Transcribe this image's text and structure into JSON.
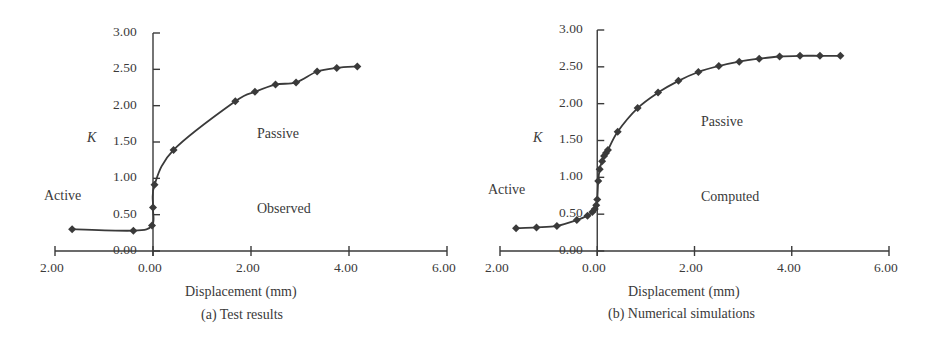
{
  "chart_data": [
    {
      "type": "line",
      "title": "(a) Test results",
      "xlabel": "Displacement (mm)",
      "ylabel": "K",
      "x_tick_labels": [
        "2.00",
        "0.00",
        "2.00",
        "4.00",
        "6.00"
      ],
      "x_ticks": [
        -2,
        0,
        2,
        4,
        6
      ],
      "y_tick_labels": [
        "0.00",
        "0.50",
        "1.00",
        "1.50",
        "2.00",
        "2.50",
        "3.00"
      ],
      "y_ticks": [
        0,
        0.5,
        1.0,
        1.5,
        2.0,
        2.5,
        3.0
      ],
      "xlim": [
        -2,
        6
      ],
      "ylim": [
        0,
        3
      ],
      "grid": false,
      "annotations": [
        "Active",
        "Passive",
        "Observed"
      ],
      "marker": "diamond",
      "series": [
        {
          "name": "Observed",
          "x": [
            -1.65,
            -0.4,
            -0.02,
            0.0,
            0.03,
            0.42,
            1.68,
            2.08,
            2.5,
            2.92,
            3.35,
            3.75,
            4.17
          ],
          "y": [
            0.3,
            0.28,
            0.35,
            0.6,
            0.91,
            1.39,
            2.06,
            2.19,
            2.29,
            2.32,
            2.47,
            2.52,
            2.54
          ]
        }
      ]
    },
    {
      "type": "line",
      "title": "(b) Numerical simulations",
      "xlabel": "Displacement (mm)",
      "ylabel": "K",
      "x_tick_labels": [
        "2.00",
        "0.00",
        "2.00",
        "4.00",
        "6.00"
      ],
      "x_ticks": [
        -2,
        0,
        2,
        4,
        6
      ],
      "y_tick_labels": [
        "0.00",
        "0.50",
        "1.00",
        "1.50",
        "2.00",
        "2.50",
        "3.00"
      ],
      "y_ticks": [
        0,
        0.5,
        1.0,
        1.5,
        2.0,
        2.5,
        3.0
      ],
      "xlim": [
        -2,
        6
      ],
      "ylim": [
        0,
        3
      ],
      "grid": false,
      "annotations": [
        "Active",
        "Passive",
        "Computed"
      ],
      "marker": "diamond",
      "series": [
        {
          "name": "Computed",
          "x": [
            -1.67,
            -1.25,
            -0.83,
            -0.42,
            -0.2,
            -0.1,
            -0.05,
            -0.02,
            0.0,
            0.02,
            0.05,
            0.1,
            0.14,
            0.18,
            0.22,
            0.42,
            0.83,
            1.25,
            1.67,
            2.08,
            2.5,
            2.92,
            3.33,
            3.75,
            4.17,
            4.58,
            5.0
          ],
          "y": [
            0.31,
            0.32,
            0.34,
            0.42,
            0.48,
            0.53,
            0.57,
            0.62,
            0.7,
            0.95,
            1.11,
            1.22,
            1.29,
            1.33,
            1.37,
            1.62,
            1.94,
            2.15,
            2.31,
            2.43,
            2.51,
            2.57,
            2.61,
            2.64,
            2.65,
            2.65,
            2.65
          ]
        }
      ]
    }
  ],
  "panels": [
    {
      "ylabel": "K",
      "xlabel": "Displacement (mm)",
      "caption": "(a) Test results",
      "region_active": "Active",
      "region_passive": "Passive",
      "curve_label": "Observed",
      "y_ticks": [
        "3.00",
        "2.50",
        "2.00",
        "1.50",
        "1.00",
        "0.50",
        "0.00"
      ],
      "x_ticks": [
        "2.00",
        "0.00",
        "2.00",
        "4.00",
        "6.00"
      ]
    },
    {
      "ylabel": "K",
      "xlabel": "Displacement (mm)",
      "caption": "(b) Numerical simulations",
      "region_active": "Active",
      "region_passive": "Passive",
      "curve_label": "Computed",
      "y_ticks": [
        "3.00",
        "2.50",
        "2.00",
        "1.50",
        "1.00",
        "0.50",
        "0.00"
      ],
      "x_ticks": [
        "2.00",
        "0.00",
        "2.00",
        "4.00",
        "6.00"
      ]
    }
  ],
  "colors": {
    "ink": "#3a3a3a",
    "background": "#ffffff"
  }
}
